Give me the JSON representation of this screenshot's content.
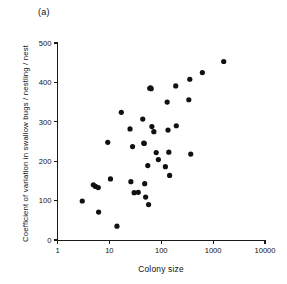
{
  "figure": {
    "panel_label": "(a)",
    "background_color": "#ffffff",
    "point_color": "#111111",
    "axis_color": "#1a1a1a"
  },
  "chart_data": {
    "type": "scatter",
    "title": "",
    "panel": "(a)",
    "xlabel": "Colony size",
    "ylabel": "Coefficient of variation in swallow bugs / nestling / nest",
    "xscale": "log",
    "yscale": "linear",
    "xlim": [
      1,
      10000
    ],
    "ylim": [
      0,
      500
    ],
    "xticks": [
      1,
      10,
      100,
      1000,
      10000
    ],
    "xticklabels": [
      "1",
      "10",
      "100",
      "1000",
      "10000"
    ],
    "yticks": [
      0,
      100,
      200,
      300,
      400,
      500
    ],
    "yticklabels": [
      "0",
      "100",
      "200",
      "300",
      "400",
      "500"
    ],
    "grid": false,
    "legend": null,
    "marker": "filled-circle",
    "n_points": 40,
    "points": [
      {
        "x": 3.0,
        "y": 99
      },
      {
        "x": 4.9,
        "y": 140
      },
      {
        "x": 5.4,
        "y": 136
      },
      {
        "x": 6.1,
        "y": 133
      },
      {
        "x": 6.2,
        "y": 71
      },
      {
        "x": 9.3,
        "y": 248
      },
      {
        "x": 10.5,
        "y": 155
      },
      {
        "x": 14.0,
        "y": 35
      },
      {
        "x": 17.0,
        "y": 324
      },
      {
        "x": 25.0,
        "y": 282
      },
      {
        "x": 26.0,
        "y": 148
      },
      {
        "x": 28.0,
        "y": 237
      },
      {
        "x": 30.0,
        "y": 120
      },
      {
        "x": 44.0,
        "y": 307
      },
      {
        "x": 46.0,
        "y": 246
      },
      {
        "x": 48.0,
        "y": 143
      },
      {
        "x": 50.0,
        "y": 109
      },
      {
        "x": 55.0,
        "y": 189
      },
      {
        "x": 57.0,
        "y": 90
      },
      {
        "x": 60.0,
        "y": 385
      },
      {
        "x": 64.0,
        "y": 384
      },
      {
        "x": 66.0,
        "y": 288
      },
      {
        "x": 72.0,
        "y": 275
      },
      {
        "x": 80.0,
        "y": 222
      },
      {
        "x": 88.0,
        "y": 204
      },
      {
        "x": 120.0,
        "y": 186
      },
      {
        "x": 130.0,
        "y": 350
      },
      {
        "x": 135.0,
        "y": 279
      },
      {
        "x": 140.0,
        "y": 223
      },
      {
        "x": 145.0,
        "y": 164
      },
      {
        "x": 190.0,
        "y": 391
      },
      {
        "x": 195.0,
        "y": 290
      },
      {
        "x": 340.0,
        "y": 356
      },
      {
        "x": 355.0,
        "y": 408
      },
      {
        "x": 370.0,
        "y": 218
      },
      {
        "x": 620.0,
        "y": 425
      },
      {
        "x": 1600.0,
        "y": 453
      },
      {
        "x": 47.0,
        "y": 245
      },
      {
        "x": 62.0,
        "y": 386
      },
      {
        "x": 36.0,
        "y": 121
      }
    ]
  },
  "axes": {
    "x_tick_labels": [
      "1",
      "10",
      "100",
      "1000",
      "10000"
    ],
    "y_tick_labels": [
      "0",
      "100",
      "200",
      "300",
      "400",
      "500"
    ]
  }
}
